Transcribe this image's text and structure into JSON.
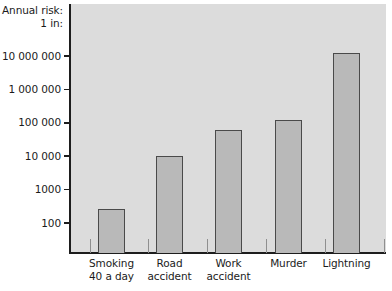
{
  "chart_data": {
    "type": "bar",
    "title": "",
    "subtitle": "",
    "ylabel": "Annual risk:\n1 in:",
    "xlabel": "",
    "yscale": "log",
    "ylim": [
      100,
      30000000
    ],
    "grid": false,
    "legend": null,
    "categories": [
      "Smoking\n40 a day",
      "Road\naccident",
      "Work\naccident",
      "Murder",
      "Lightning"
    ],
    "values": [
      260,
      10000,
      60000,
      120000,
      12000000
    ],
    "ytick_labels": [
      "100",
      "1000",
      "10 000",
      "100 000",
      "1 000 000",
      "10 000 000"
    ],
    "ytick_values": [
      100,
      1000,
      10000,
      100000,
      1000000,
      10000000
    ],
    "colors": {
      "plot_background": "#dcdcdc",
      "bar_fill": "#b9b9b9",
      "bar_outline": "#4a4a4a",
      "axis": "#1d1d1d",
      "text": "#1b1b1b",
      "page_background": "#ffffff"
    }
  }
}
